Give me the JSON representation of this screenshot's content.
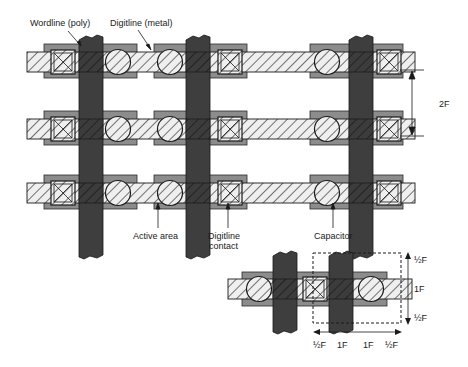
{
  "diagram": {
    "labels": {
      "wordline": "Wordline (poly)",
      "digitline": "Digitline (metal)",
      "active_area": "Active area",
      "digitline_contact_1": "Digitline",
      "digitline_contact_2": "contact",
      "capacitor": "Capacitor",
      "pitch_2f": "2F"
    },
    "cell_inset": {
      "vertical_dims": [
        "½F",
        "1F",
        "½F"
      ],
      "horizontal_dims": [
        "½F",
        "1F",
        "1F",
        "½F"
      ]
    },
    "colors": {
      "wordline": "#3a3a3a",
      "active_area": "#8a8a8a",
      "digitline_fill": "#e8e8e8",
      "hatch": "#2a2a2a",
      "line": "#1a1a1a"
    }
  }
}
